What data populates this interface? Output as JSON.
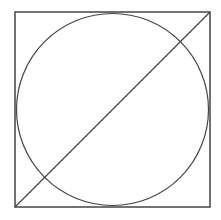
{
  "diagram": {
    "background": "#ffffff",
    "stroke_color": "#444444",
    "square": {
      "x": 15,
      "y": 12,
      "size": 195
    },
    "circle": {
      "cx": 112.5,
      "cy": 109.5,
      "r": 96
    },
    "diagonal": {
      "x1": 15,
      "y1": 207,
      "x2": 210,
      "y2": 12
    }
  }
}
